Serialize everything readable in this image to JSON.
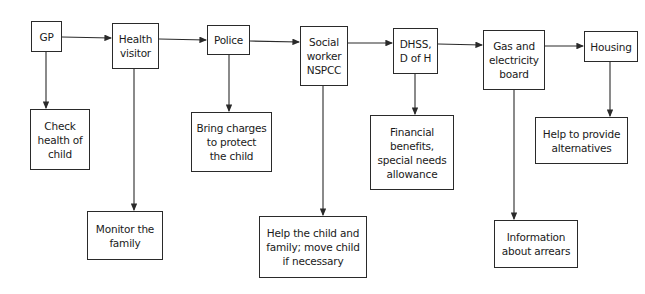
{
  "diagram": {
    "type": "flowchart",
    "ink_color": "#2a2a2a",
    "background": "#ffffff",
    "main_chain": [
      {
        "id": "gp",
        "label": "GP"
      },
      {
        "id": "health_visitor",
        "label": "Health\nvisitor"
      },
      {
        "id": "police",
        "label": "Police"
      },
      {
        "id": "social_worker",
        "label": "Social\nworker\nNSPCC"
      },
      {
        "id": "dhss",
        "label": "DHSS,\nD of H"
      },
      {
        "id": "gas_electricity",
        "label": "Gas and\nelectricity\nboard"
      },
      {
        "id": "housing",
        "label": "Housing"
      }
    ],
    "roles": [
      {
        "id": "check_health",
        "from": "gp",
        "label": "Check\nhealth of\nchild"
      },
      {
        "id": "monitor_family",
        "from": "health_visitor",
        "label": "Monitor the\nfamily"
      },
      {
        "id": "bring_charges",
        "from": "police",
        "label": "Bring charges\nto protect\nthe child"
      },
      {
        "id": "help_child",
        "from": "social_worker",
        "label": "Help the child and\nfamily; move child\nif necessary"
      },
      {
        "id": "financial_benefits",
        "from": "dhss",
        "label": "Financial\nbenefits,\nspecial needs\nallowance"
      },
      {
        "id": "info_arrears",
        "from": "gas_electricity",
        "label": "Information\nabout arrears"
      },
      {
        "id": "alternatives",
        "from": "housing",
        "label": "Help to provide\nalternatives"
      }
    ],
    "edges": [
      [
        "gp",
        "health_visitor"
      ],
      [
        "health_visitor",
        "police"
      ],
      [
        "police",
        "social_worker"
      ],
      [
        "social_worker",
        "dhss"
      ],
      [
        "dhss",
        "gas_electricity"
      ],
      [
        "gas_electricity",
        "housing"
      ],
      [
        "gp",
        "check_health"
      ],
      [
        "health_visitor",
        "monitor_family"
      ],
      [
        "police",
        "bring_charges"
      ],
      [
        "social_worker",
        "help_child"
      ],
      [
        "dhss",
        "financial_benefits"
      ],
      [
        "gas_electricity",
        "info_arrears"
      ],
      [
        "housing",
        "alternatives"
      ]
    ]
  }
}
